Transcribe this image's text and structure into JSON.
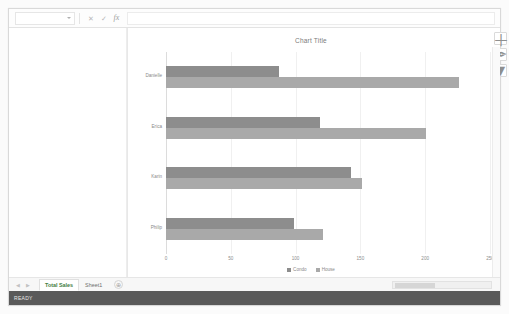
{
  "formula_bar": {
    "name_box_value": "",
    "cancel_label": "✕",
    "confirm_label": "✓",
    "fx_label": "fx",
    "formula_value": ""
  },
  "chart": {
    "title": "Chart Title",
    "buttons": [
      {
        "name": "chart-elements",
        "glyph": "＋"
      },
      {
        "name": "chart-styles",
        "glyph": "✒"
      },
      {
        "name": "chart-filters",
        "glyph": "▼"
      }
    ]
  },
  "sheet_tabs": {
    "nav_first": "⏮",
    "nav_prev": "◀",
    "nav_next": "▶",
    "nav_last": "⏭",
    "tabs": [
      {
        "label": "Total Sales",
        "active": true
      },
      {
        "label": "Sheet1",
        "active": false
      }
    ],
    "add_label": "⊕"
  },
  "status": {
    "text": "READY"
  },
  "chart_data": {
    "type": "bar",
    "orientation": "horizontal",
    "title": "Chart Title",
    "xlabel": "",
    "ylabel": "",
    "categories": [
      "Danielle",
      "Erica",
      "Karin",
      "Philip"
    ],
    "series": [
      {
        "name": "Condo",
        "color": "#8d8d8d",
        "values": [
          87,
          119,
          143,
          99
        ]
      },
      {
        "name": "House",
        "color": "#a9a9a9",
        "values": [
          226,
          201,
          151,
          121
        ]
      }
    ],
    "xticks": [
      0,
      50,
      100,
      150,
      200,
      250
    ],
    "xlim": [
      0,
      250
    ],
    "grid": true,
    "legend_position": "bottom"
  }
}
